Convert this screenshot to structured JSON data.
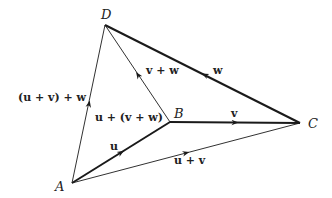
{
  "diagram": {
    "points": {
      "A": {
        "label": "A",
        "x": 72,
        "y": 183
      },
      "B": {
        "label": "B",
        "x": 170,
        "y": 122
      },
      "C": {
        "label": "C",
        "x": 300,
        "y": 123
      },
      "D": {
        "label": "D",
        "x": 105,
        "y": 25
      }
    },
    "vectors": {
      "u": {
        "label": "u",
        "from": "A",
        "to": "B",
        "weight": "thick"
      },
      "v": {
        "label": "v",
        "from": "B",
        "to": "C",
        "weight": "thick"
      },
      "w": {
        "label": "w",
        "from": "C",
        "to": "D",
        "weight": "thick"
      },
      "u_plus_v": {
        "label": "u + v",
        "from": "A",
        "to": "C",
        "weight": "thin"
      },
      "v_plus_w": {
        "label": "v + w",
        "from": "B",
        "to": "D",
        "weight": "thin"
      },
      "sum_left": {
        "label": "(u + v) + w",
        "from": "A",
        "to": "D",
        "weight": "thin"
      },
      "sum_right_label": {
        "label": "u + (v + w)"
      }
    },
    "colors": {
      "stroke": "#1a1a1a",
      "text": "#222222",
      "background": "#ffffff"
    }
  }
}
